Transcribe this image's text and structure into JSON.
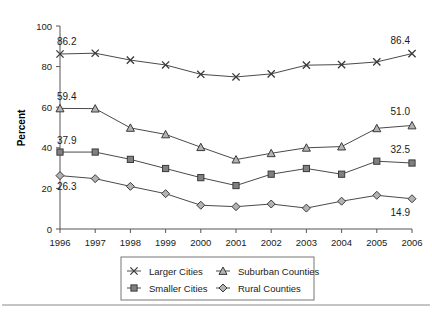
{
  "chart_data": {
    "type": "line",
    "title": "",
    "xlabel": "",
    "ylabel": "Percent",
    "categories": [
      "1996",
      "1997",
      "1998",
      "1999",
      "2000",
      "2001",
      "2002",
      "2003",
      "2004",
      "2005",
      "2006"
    ],
    "ylim": [
      0,
      100
    ],
    "yticks": [
      0,
      20,
      40,
      60,
      80,
      100
    ],
    "grid": false,
    "legend_position": "bottom",
    "series": [
      {
        "name": "Larger Cities",
        "marker": "x",
        "values": [
          86.2,
          86.6,
          83.2,
          80.8,
          76.2,
          74.9,
          76.4,
          80.7,
          81.0,
          82.3,
          86.4
        ],
        "start_label": "86.2",
        "end_label": "86.4"
      },
      {
        "name": "Suburban Counties",
        "marker": "triangle",
        "values": [
          59.4,
          59.3,
          49.8,
          46.6,
          40.3,
          34.2,
          37.3,
          40.0,
          40.6,
          49.6,
          51.0
        ],
        "start_label": "59.4",
        "end_label": "51.0"
      },
      {
        "name": "Smaller Cities",
        "marker": "square",
        "values": [
          37.9,
          37.9,
          34.3,
          29.8,
          25.3,
          21.4,
          27.0,
          29.8,
          27.0,
          33.4,
          32.5
        ],
        "start_label": "37.9",
        "end_label": "32.5"
      },
      {
        "name": "Rural Counties",
        "marker": "diamond",
        "values": [
          26.3,
          24.8,
          21.0,
          17.4,
          11.7,
          11.0,
          12.3,
          10.3,
          13.7,
          16.6,
          14.9
        ],
        "start_label": "26.3",
        "end_label": "14.9"
      }
    ],
    "annotations": [
      {
        "text": "86.2",
        "series": "Larger Cities",
        "position": "top-left"
      },
      {
        "text": "86.4",
        "series": "Larger Cities",
        "position": "top-right"
      },
      {
        "text": "59.4",
        "series": "Suburban Counties",
        "position": "top-left"
      },
      {
        "text": "51.0",
        "series": "Suburban Counties",
        "position": "top-right"
      },
      {
        "text": "37.9",
        "series": "Smaller Cities",
        "position": "top-left"
      },
      {
        "text": "32.5",
        "series": "Smaller Cities",
        "position": "top-right"
      },
      {
        "text": "26.3",
        "series": "Rural Counties",
        "position": "bottom-left"
      },
      {
        "text": "14.9",
        "series": "Rural Counties",
        "position": "bottom-right"
      }
    ],
    "colors": {
      "line": "#4a4a4a",
      "marker_stroke": "#3a3a3a",
      "square_fill": "#808080",
      "triangle_fill": "#b3b3b3",
      "diamond_fill": "#b3b3b3",
      "axis": "#555555",
      "text": "#1a1a1a",
      "background": "#ffffff"
    }
  },
  "legend": {
    "entries": [
      {
        "label": "Larger Cities",
        "marker": "x"
      },
      {
        "label": "Suburban Counties",
        "marker": "triangle"
      },
      {
        "label": "Smaller Cities",
        "marker": "square"
      },
      {
        "label": "Rural Counties",
        "marker": "diamond"
      }
    ]
  }
}
